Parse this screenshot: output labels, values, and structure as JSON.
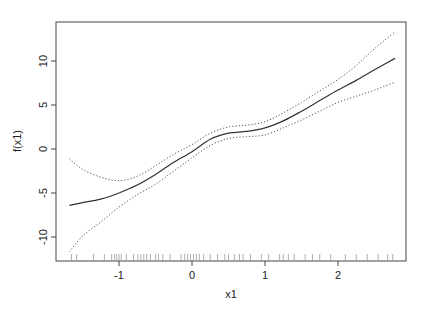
{
  "chart_data": {
    "type": "line",
    "title": "",
    "xlabel": "x1",
    "ylabel": "f(x1)",
    "xlim": [
      -1.85,
      2.92
    ],
    "ylim": [
      -12.8,
      14.4
    ],
    "x_ticks": [
      -1,
      0,
      1,
      2
    ],
    "x_tick_labels": [
      "-1",
      "0",
      "1",
      "2"
    ],
    "y_ticks": [
      -10,
      -5,
      0,
      5,
      10
    ],
    "y_tick_labels": [
      "-10",
      "-5",
      "0",
      "5",
      "10"
    ],
    "grid": false,
    "legend": null,
    "x": [
      -1.68,
      -1.5,
      -1.25,
      -1.0,
      -0.75,
      -0.5,
      -0.25,
      0.0,
      0.25,
      0.5,
      0.75,
      1.0,
      1.25,
      1.5,
      1.75,
      2.0,
      2.25,
      2.5,
      2.78
    ],
    "series": [
      {
        "name": "fit",
        "style": "solid",
        "values": [
          -6.4,
          -6.1,
          -5.7,
          -5.0,
          -4.1,
          -2.9,
          -1.5,
          -0.3,
          1.1,
          1.8,
          2.0,
          2.4,
          3.2,
          4.3,
          5.5,
          6.7,
          7.8,
          9.0,
          10.3
        ]
      },
      {
        "name": "upper band",
        "style": "dotted",
        "values": [
          -1.1,
          -2.3,
          -3.2,
          -3.6,
          -3.1,
          -1.9,
          -0.6,
          0.5,
          1.8,
          2.5,
          2.7,
          3.1,
          4.1,
          5.3,
          6.6,
          7.9,
          9.5,
          11.4,
          13.3
        ]
      },
      {
        "name": "lower band",
        "style": "dotted",
        "values": [
          -11.7,
          -9.9,
          -8.3,
          -6.6,
          -5.2,
          -4.0,
          -2.5,
          -1.0,
          0.4,
          1.2,
          1.4,
          1.6,
          2.4,
          3.3,
          4.3,
          5.3,
          6.0,
          6.7,
          7.6
        ]
      }
    ],
    "rug_x": [
      -1.65,
      -1.58,
      -1.35,
      -1.2,
      -1.1,
      -1.06,
      -1.03,
      -1.0,
      -0.97,
      -0.9,
      -0.8,
      -0.74,
      -0.7,
      -0.66,
      -0.62,
      -0.57,
      -0.5,
      -0.46,
      -0.4,
      -0.3,
      -0.15,
      -0.1,
      -0.06,
      -0.02,
      0.02,
      0.06,
      0.1,
      0.16,
      0.25,
      0.35,
      0.45,
      0.5,
      0.58,
      0.65,
      0.7,
      0.8,
      0.95,
      1.05,
      1.2,
      1.25,
      1.32,
      1.4,
      1.55,
      1.65,
      1.75,
      1.9,
      2.1,
      2.25,
      2.4,
      2.55,
      2.68,
      2.75
    ]
  }
}
